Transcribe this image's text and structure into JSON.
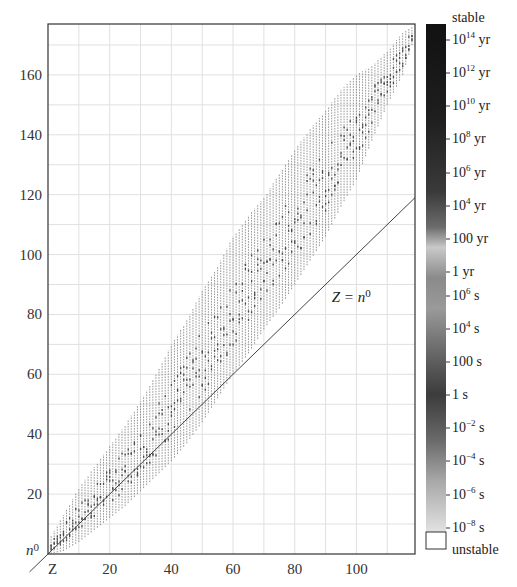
{
  "chart_data": {
    "type": "scatter",
    "title": "",
    "xlabel": "Z",
    "ylabel": "n0",
    "xlim": [
      0,
      119
    ],
    "ylim": [
      0,
      177
    ],
    "grid": true,
    "x_ticks": [
      20,
      40,
      60,
      80,
      100
    ],
    "y_ticks": [
      20,
      40,
      60,
      80,
      100,
      120,
      140,
      160
    ],
    "x_tick_labels": [
      "20",
      "40",
      "60",
      "80",
      "100"
    ],
    "y_tick_labels": [
      "20",
      "40",
      "60",
      "80",
      "100",
      "120",
      "140",
      "160"
    ],
    "axis_corner_labels": {
      "x": "Z",
      "y": "n0"
    },
    "reference_line": {
      "label": "Z = n0",
      "equation": "n0 = Z",
      "label_position": [
        92,
        84
      ]
    },
    "band": {
      "description": "Known nuclides: for each proton number Z, a vertical run of neutron numbers N from n_min to n_max",
      "Z": [
        1,
        5,
        10,
        15,
        20,
        25,
        30,
        35,
        40,
        45,
        50,
        55,
        60,
        65,
        70,
        75,
        80,
        85,
        90,
        95,
        100,
        105,
        110,
        115,
        118
      ],
      "n_min": [
        0,
        1,
        4,
        8,
        12,
        16,
        21,
        26,
        31,
        37,
        44,
        52,
        60,
        67,
        75,
        82,
        90,
        98,
        106,
        116,
        125,
        138,
        150,
        160,
        170
      ],
      "n_max": [
        6,
        13,
        22,
        29,
        36,
        43,
        51,
        60,
        70,
        78,
        88,
        96,
        106,
        113,
        119,
        127,
        135,
        142,
        148,
        155,
        160,
        163,
        168,
        174,
        176
      ]
    },
    "colorbar": {
      "title": "half-life",
      "labels": [
        "stable",
        "10^14 yr",
        "10^12 yr",
        "10^10 yr",
        "10^8 yr",
        "10^6 yr",
        "10^4 yr",
        "100 yr",
        "1 yr",
        "10^6 s",
        "10^4 s",
        "100 s",
        "1 s",
        "10^-2 s",
        "10^-4 s",
        "10^-6 s",
        "10^-8 s",
        "unstable"
      ]
    }
  },
  "axes": {
    "x_ticks": [
      {
        "value": 20,
        "label": "20"
      },
      {
        "value": 40,
        "label": "40"
      },
      {
        "value": 60,
        "label": "60"
      },
      {
        "value": 80,
        "label": "80"
      },
      {
        "value": 100,
        "label": "100"
      }
    ],
    "y_ticks": [
      {
        "value": 20,
        "label": "20"
      },
      {
        "value": 40,
        "label": "40"
      },
      {
        "value": 60,
        "label": "60"
      },
      {
        "value": 80,
        "label": "80"
      },
      {
        "value": 100,
        "label": "100"
      },
      {
        "value": 120,
        "label": "120"
      },
      {
        "value": 140,
        "label": "140"
      },
      {
        "value": 160,
        "label": "160"
      }
    ],
    "x_corner_label": "Z",
    "y_corner_label_base": "n",
    "y_corner_label_sup": "0"
  },
  "annotation": {
    "base": "Z = n",
    "sup": "0"
  },
  "colorbar": {
    "entries": [
      {
        "base": "stable",
        "sup": "",
        "unit": "",
        "y": 12
      },
      {
        "base": "10",
        "sup": "14",
        "unit": " yr",
        "y": 34
      },
      {
        "base": "10",
        "sup": "12",
        "unit": " yr",
        "y": 67
      },
      {
        "base": "10",
        "sup": "10",
        "unit": " yr",
        "y": 100
      },
      {
        "base": "10",
        "sup": "8",
        "unit": " yr",
        "y": 133
      },
      {
        "base": "10",
        "sup": "6",
        "unit": " yr",
        "y": 167
      },
      {
        "base": "10",
        "sup": "4",
        "unit": " yr",
        "y": 200
      },
      {
        "base": "100 yr",
        "sup": "",
        "unit": "",
        "y": 233
      },
      {
        "base": "1 yr",
        "sup": "",
        "unit": "",
        "y": 266
      },
      {
        "base": "10",
        "sup": "6",
        "unit": " s",
        "y": 290
      },
      {
        "base": "10",
        "sup": "4",
        "unit": " s",
        "y": 323
      },
      {
        "base": "100 s",
        "sup": "",
        "unit": "",
        "y": 356
      },
      {
        "base": "1 s",
        "sup": "",
        "unit": "",
        "y": 389
      },
      {
        "base": "10",
        "sup": "−2",
        "unit": " s",
        "y": 422
      },
      {
        "base": "10",
        "sup": "−4",
        "unit": " s",
        "y": 455
      },
      {
        "base": "10",
        "sup": "−6",
        "unit": " s",
        "y": 489
      },
      {
        "base": "10",
        "sup": "−8",
        "unit": " s",
        "y": 522
      },
      {
        "base": "unstable",
        "sup": "",
        "unit": "",
        "y": 544
      }
    ],
    "gradient_stops": [
      {
        "offset": 0.0,
        "color": "#111111"
      },
      {
        "offset": 0.18,
        "color": "#1e1e1e"
      },
      {
        "offset": 0.33,
        "color": "#3a3a3a"
      },
      {
        "offset": 0.4,
        "color": "#6c6c6c"
      },
      {
        "offset": 0.44,
        "color": "#c9c9c9"
      },
      {
        "offset": 0.5,
        "color": "#8a8a8a"
      },
      {
        "offset": 0.56,
        "color": "#9a9a9a"
      },
      {
        "offset": 0.62,
        "color": "#777777"
      },
      {
        "offset": 0.68,
        "color": "#555555"
      },
      {
        "offset": 0.73,
        "color": "#3c3c3c"
      },
      {
        "offset": 0.82,
        "color": "#6a6a6a"
      },
      {
        "offset": 0.9,
        "color": "#a8a8a8"
      },
      {
        "offset": 1.0,
        "color": "#e2e2e2"
      }
    ]
  },
  "colors": {
    "grid": "#e0e0e0",
    "frame": "#333333",
    "band": "#8c8c8c",
    "band_dark": "#4a4a4a",
    "reference_line": "#444444"
  }
}
